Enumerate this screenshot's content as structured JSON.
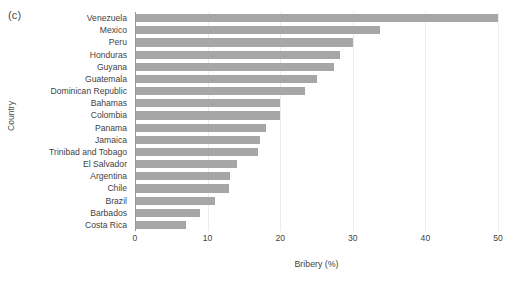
{
  "panel": {
    "label": "(c)"
  },
  "axes": {
    "y_title": "Country",
    "x_title": "Bribery (%)"
  },
  "chart_data": {
    "type": "bar",
    "orientation": "horizontal",
    "title": "(c)",
    "xlabel": "Bribery (%)",
    "ylabel": "Country",
    "xlim": [
      0,
      50
    ],
    "xticks": [
      0,
      10,
      20,
      30,
      40,
      50
    ],
    "xtick_labels": [
      "0",
      "10",
      "20",
      "30",
      "40",
      "50"
    ],
    "grid": "vertical-major-only",
    "legend": "none",
    "bar_color": "#a6a6a6",
    "categories": [
      "Venezuela",
      "Mexico",
      "Peru",
      "Honduras",
      "Guyana",
      "Guatemala",
      "Dominican Republic",
      "Bahamas",
      "Colombia",
      "Panama",
      "Jamaica",
      "Trinibad and Tobago",
      "El Salvador",
      "Argentina",
      "Chile",
      "Brazil",
      "Barbados",
      "Costa Rica"
    ],
    "values": [
      50.0,
      33.8,
      30.0,
      28.3,
      27.4,
      25.0,
      23.4,
      20.0,
      20.0,
      18.0,
      17.2,
      17.0,
      14.0,
      13.1,
      13.0,
      11.0,
      9.0,
      7.0
    ]
  }
}
